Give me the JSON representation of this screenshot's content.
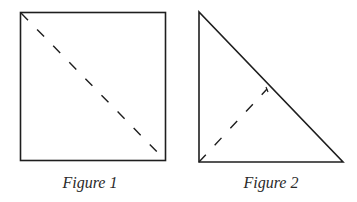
{
  "figures": [
    {
      "id": "figure-1",
      "caption": "Figure 1",
      "shape": "square",
      "fold_line": "diagonal from top-left corner to bottom-right corner",
      "line_style": "dashed"
    },
    {
      "id": "figure-2",
      "caption": "Figure 2",
      "shape": "right isosceles triangle",
      "fold_line": "from right-angle corner to midpoint of hypotenuse",
      "line_style": "dashed"
    }
  ],
  "colors": {
    "stroke": "#1e1e1e",
    "background": "#ffffff",
    "caption": "#2a2a2a"
  }
}
